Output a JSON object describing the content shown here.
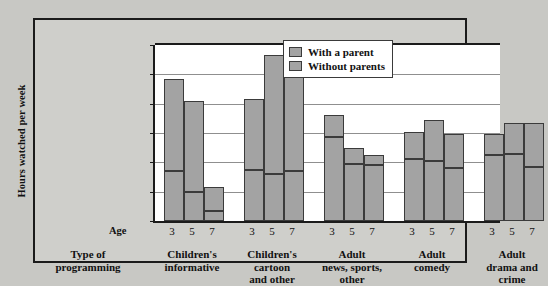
{
  "chart_data": {
    "type": "bar",
    "subtype": "stacked-grouped",
    "title": "",
    "xlabel": "Type of programming",
    "ylabel": "Hours watched per week",
    "ylim": [
      0,
      6
    ],
    "yticks": [
      "0",
      "1",
      "2",
      "3",
      "4",
      "5",
      "6"
    ],
    "grid": true,
    "legend_position": "top-right",
    "group_axis_label": "Age",
    "categories": [
      "Children's informative",
      "Children's cartoon and other",
      "Adult news, sports, other",
      "Adult comedy",
      "Adult drama and crime"
    ],
    "category_lines": [
      [
        "Children's",
        "informative"
      ],
      [
        "Children's",
        "cartoon",
        "and other"
      ],
      [
        "Adult",
        "news, sports,",
        "other"
      ],
      [
        "Adult",
        "comedy"
      ],
      [
        "Adult",
        "drama and",
        "crime"
      ]
    ],
    "ages": [
      "3",
      "5",
      "7"
    ],
    "series": [
      {
        "name": "With a parent",
        "color": "#a3a3a3",
        "values": [
          [
            1.7,
            1.0,
            0.35
          ],
          [
            1.75,
            1.6,
            1.7
          ],
          [
            2.85,
            1.95,
            1.9
          ],
          [
            2.1,
            2.05,
            1.8
          ],
          [
            2.25,
            2.3,
            1.85
          ]
        ]
      },
      {
        "name": "Without parents",
        "color": "#a3a3a3",
        "values": [
          [
            3.15,
            3.1,
            0.8
          ],
          [
            2.4,
            4.05,
            3.6
          ],
          [
            0.75,
            0.55,
            0.35
          ],
          [
            0.95,
            1.4,
            1.15
          ],
          [
            0.7,
            1.05,
            1.5
          ]
        ]
      }
    ],
    "totals": [
      [
        4.85,
        4.1,
        1.15
      ],
      [
        4.15,
        5.65,
        5.3
      ],
      [
        3.6,
        2.5,
        2.25
      ],
      [
        3.05,
        3.45,
        2.95
      ],
      [
        2.95,
        3.35,
        3.35
      ]
    ]
  },
  "legend": {
    "items": [
      {
        "label": "With a parent"
      },
      {
        "label": "Without parents"
      }
    ]
  },
  "axis": {
    "y_title": "Hours watched per week",
    "age_caption": "Age",
    "type_caption_line1": "Type of",
    "type_caption_line2": "programming"
  }
}
